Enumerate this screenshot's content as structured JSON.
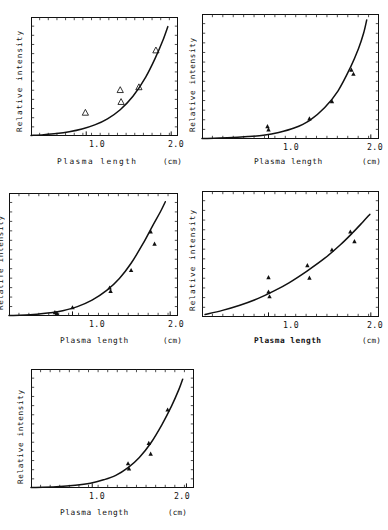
{
  "figure": {
    "background": "#ffffff",
    "ink": "#111111",
    "panel_count": 5,
    "marker_symbol": "triangle",
    "marker_symbol_glyph": "△"
  },
  "chart_data": [
    {
      "type": "line",
      "panel_index": 1,
      "title": "",
      "xlabel": "Plasma  length",
      "xlabel_style": "wide-spaced",
      "ylabel": "Relative intensity",
      "unit": "(cm)",
      "xlim": [
        0.35,
        2.08
      ],
      "ylim": [
        0,
        1.05
      ],
      "xticks": [
        1.0,
        2.0
      ],
      "xtick_labels": [
        "1.0",
        "2.0"
      ],
      "yticks_labeled": false,
      "grid": false,
      "legend": "none",
      "marker_style": "open-triangle",
      "series": [
        {
          "name": "fit curve",
          "kind": "line",
          "x": [
            0.35,
            0.5,
            0.65,
            0.8,
            0.95,
            1.1,
            1.25,
            1.4,
            1.55,
            1.7,
            1.82,
            1.9,
            1.96
          ],
          "y": [
            0.005,
            0.012,
            0.022,
            0.038,
            0.062,
            0.098,
            0.152,
            0.232,
            0.35,
            0.52,
            0.7,
            0.84,
            0.965
          ]
        },
        {
          "name": "measured points",
          "kind": "scatter",
          "x": [
            0.99,
            1.4,
            1.41,
            1.62,
            1.82
          ],
          "y": [
            0.205,
            0.405,
            0.3,
            0.43,
            0.755
          ]
        }
      ]
    },
    {
      "type": "line",
      "panel_index": 2,
      "title": "",
      "xlabel": "Plasma length",
      "xlabel_style": "normal",
      "ylabel": "Relative intensity",
      "unit": "(cm)",
      "xlim": [
        0.35,
        2.08
      ],
      "ylim": [
        0,
        1.05
      ],
      "xticks": [
        1.0,
        2.0
      ],
      "xtick_labels": [
        "1.0",
        "2.0"
      ],
      "yticks_labeled": false,
      "grid": false,
      "legend": "none",
      "marker_style": "filled-triangle",
      "series": [
        {
          "name": "fit curve",
          "kind": "line",
          "x": [
            0.35,
            0.6,
            0.8,
            0.95,
            1.1,
            1.25,
            1.4,
            1.55,
            1.68,
            1.8,
            1.88,
            1.93,
            1.96
          ],
          "y": [
            0.004,
            0.01,
            0.02,
            0.032,
            0.055,
            0.092,
            0.155,
            0.265,
            0.405,
            0.6,
            0.76,
            0.89,
            1.0
          ]
        },
        {
          "name": "measured points",
          "kind": "scatter",
          "x": [
            0.99,
            1.0,
            1.4,
            1.62,
            1.81,
            1.83
          ],
          "y": [
            0.105,
            0.078,
            0.17,
            0.315,
            0.58,
            0.545
          ]
        }
      ]
    },
    {
      "type": "line",
      "panel_index": 3,
      "title": "",
      "xlabel": "Plasma length",
      "xlabel_style": "normal",
      "ylabel": "Relatife intensity",
      "unit": "(cm)",
      "xlim": [
        0.35,
        2.08
      ],
      "ylim": [
        0,
        1.05
      ],
      "xticks": [
        1.0,
        2.0
      ],
      "xtick_labels": [
        "1.0",
        "2.0"
      ],
      "yticks_labeled": false,
      "grid": false,
      "legend": "none",
      "marker_style": "filled-triangle",
      "series": [
        {
          "name": "fit curve",
          "kind": "line",
          "x": [
            0.35,
            0.6,
            0.78,
            0.9,
            1.05,
            1.2,
            1.35,
            1.48,
            1.6,
            1.72,
            1.82,
            1.9,
            1.95
          ],
          "y": [
            0.004,
            0.012,
            0.028,
            0.045,
            0.08,
            0.135,
            0.218,
            0.32,
            0.45,
            0.615,
            0.77,
            0.89,
            0.975
          ]
        },
        {
          "name": "measured points",
          "kind": "scatter",
          "x": [
            0.82,
            0.84,
            1.0,
            1.38,
            1.39,
            1.6,
            1.8,
            1.84
          ],
          "y": [
            0.03,
            0.024,
            0.072,
            0.24,
            0.212,
            0.39,
            0.72,
            0.615
          ]
        }
      ]
    },
    {
      "type": "line",
      "panel_index": 4,
      "title": "",
      "xlabel": "Plasma length",
      "xlabel_style": "bold",
      "ylabel": "Relative  intensity",
      "unit": "(cm)",
      "xlim": [
        0.35,
        2.08
      ],
      "ylim": [
        0,
        1.05
      ],
      "xticks": [
        1.0,
        2.0
      ],
      "xtick_labels": [
        "1.0",
        "2.0"
      ],
      "yticks_labeled": false,
      "grid": false,
      "legend": "none",
      "marker_style": "filled-triangle",
      "series": [
        {
          "name": "fit curve",
          "kind": "line",
          "x": [
            0.38,
            0.55,
            0.72,
            0.9,
            1.05,
            1.2,
            1.38,
            1.55,
            1.7,
            1.82,
            1.92,
            1.99
          ],
          "y": [
            0.02,
            0.055,
            0.098,
            0.155,
            0.215,
            0.285,
            0.385,
            0.49,
            0.6,
            0.7,
            0.79,
            0.855
          ]
        },
        {
          "name": "measured points",
          "kind": "scatter",
          "x": [
            1.0,
            1.0,
            1.01,
            1.38,
            1.4,
            1.62,
            1.8,
            1.84
          ],
          "y": [
            0.33,
            0.21,
            0.17,
            0.43,
            0.325,
            0.56,
            0.71,
            0.63
          ]
        }
      ]
    },
    {
      "type": "line",
      "panel_index": 5,
      "title": "",
      "xlabel": "Plasma length",
      "xlabel_style": "normal",
      "ylabel": "Relative intensity",
      "unit": "(cm)",
      "xlim": [
        0.35,
        2.08
      ],
      "ylim": [
        0,
        1.05
      ],
      "xticks": [
        1.0,
        2.0
      ],
      "xtick_labels": [
        "1.0",
        "2.0"
      ],
      "yticks_labeled": false,
      "grid": false,
      "legend": "none",
      "marker_style": "filled-triangle",
      "series": [
        {
          "name": "fit curve",
          "kind": "line",
          "x": [
            0.35,
            0.62,
            0.82,
            0.98,
            1.12,
            1.25,
            1.38,
            1.5,
            1.62,
            1.74,
            1.84,
            1.92,
            1.96
          ],
          "y": [
            0.004,
            0.012,
            0.024,
            0.042,
            0.072,
            0.112,
            0.18,
            0.27,
            0.395,
            0.56,
            0.72,
            0.87,
            0.96
          ]
        },
        {
          "name": "measured points",
          "kind": "scatter",
          "x": [
            1.38,
            1.39,
            1.6,
            1.62,
            1.8
          ],
          "y": [
            0.215,
            0.17,
            0.395,
            0.3,
            0.69
          ]
        }
      ]
    }
  ]
}
